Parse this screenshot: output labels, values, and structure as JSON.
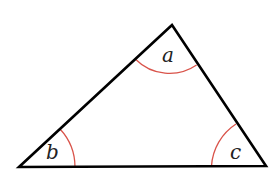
{
  "diagram": {
    "type": "triangle",
    "vertices": {
      "top": {
        "x": 172,
        "y": 25
      },
      "bottom_left": {
        "x": 19,
        "y": 167
      },
      "bottom_right": {
        "x": 266,
        "y": 166
      }
    },
    "angles": [
      {
        "vertex": "top",
        "label": "a"
      },
      {
        "vertex": "bottom_left",
        "label": "b"
      },
      {
        "vertex": "bottom_right",
        "label": "c"
      }
    ],
    "colors": {
      "edge": "#000000",
      "arc": "#d9534a",
      "label": "#222222",
      "background": "#ffffff"
    }
  }
}
